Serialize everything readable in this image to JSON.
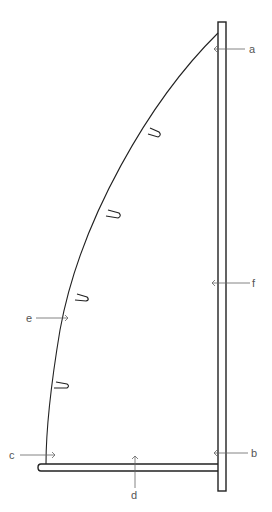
{
  "diagram": {
    "labels": {
      "a": "a",
      "b": "b",
      "c": "c",
      "d": "d",
      "e": "e",
      "f": "f"
    },
    "battens_count": 4,
    "colors": {
      "line": "#222222",
      "leader": "#666666",
      "label": "#555555",
      "background": "#ffffff"
    }
  }
}
